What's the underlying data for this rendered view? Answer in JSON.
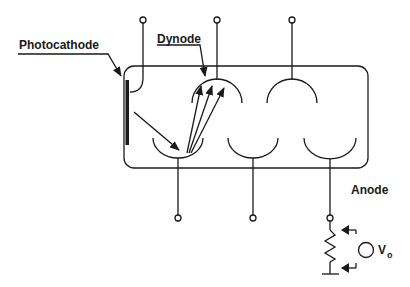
{
  "diagram": {
    "labels": {
      "photocathode": "Photocathode",
      "dynode": "Dynode",
      "anode": "Anode",
      "output_voltage_symbol": "V",
      "output_voltage_subscript": "o"
    },
    "colors": {
      "line": "#1a1a1a",
      "background": "#ffffff"
    },
    "components": [
      {
        "id": "photocathode",
        "type": "electrode"
      },
      {
        "id": "dynode-1",
        "type": "dynode",
        "position": "bottom-left"
      },
      {
        "id": "dynode-2",
        "type": "dynode",
        "position": "top-left"
      },
      {
        "id": "dynode-3",
        "type": "dynode",
        "position": "bottom-middle"
      },
      {
        "id": "dynode-4",
        "type": "dynode",
        "position": "top-right"
      },
      {
        "id": "anode",
        "type": "anode",
        "position": "bottom-right"
      },
      {
        "id": "load-resistor",
        "type": "resistor"
      },
      {
        "id": "output-voltage",
        "type": "meter"
      }
    ],
    "terminals_top": 3,
    "terminals_bottom": 3,
    "electron_arrows_secondary": 3
  }
}
